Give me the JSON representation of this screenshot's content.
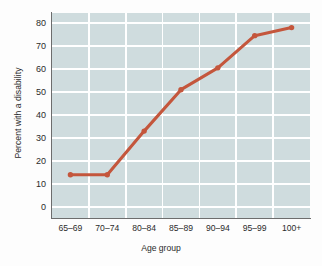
{
  "chart_data": {
    "type": "line",
    "title": "",
    "xlabel": "Age group",
    "ylabel": "Percent with a disability",
    "categories": [
      "65–69",
      "70–74",
      "80–84",
      "85–89",
      "90–94",
      "95–99",
      "100+"
    ],
    "values": [
      14,
      14,
      33,
      51,
      60.5,
      74.5,
      78
    ],
    "series": [
      {
        "name": "Percent with a disability",
        "values": [
          14,
          14,
          33,
          51,
          60.5,
          74.5,
          78
        ]
      }
    ],
    "yticks": [
      0,
      10,
      20,
      30,
      40,
      50,
      60,
      70,
      80
    ],
    "ytick_labels": [
      "0",
      "10",
      "20",
      "30",
      "40",
      "50",
      "60",
      "70",
      "80"
    ],
    "xtick_labels": [
      "65–69",
      "70–74",
      "80–84",
      "85–89",
      "90–94",
      "95–99",
      "100+"
    ],
    "ylim": [
      0,
      84
    ],
    "grid": "both",
    "legend": "none",
    "colors": {
      "line": "#c4563c",
      "marker": "#c4563c",
      "plot_background": "#cfdcde",
      "gridline": "#ffffff",
      "axis": "#6d6d6d",
      "text": "#2b2b2b",
      "page_background": "#fdfdfd"
    }
  }
}
